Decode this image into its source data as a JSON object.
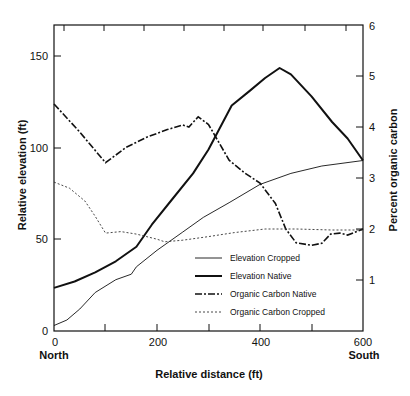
{
  "chart_data": {
    "type": "line",
    "title": "",
    "xlabel": "Relative distance (ft)",
    "ylabel": "Relative elevation (ft)",
    "ylabel_right": "Percent organic carbon",
    "xlim": [
      0,
      600
    ],
    "ylim": [
      0,
      165
    ],
    "ylim_right": [
      0,
      6
    ],
    "x_ticks": [
      0,
      200,
      400,
      600
    ],
    "x_tick_labels": [
      "0",
      "200",
      "400",
      "600"
    ],
    "x_end_annotations": {
      "left": "North",
      "right": "South"
    },
    "y_ticks": [
      0,
      50,
      100,
      150
    ],
    "y_tick_labels": [
      "0",
      "50",
      "100",
      "150"
    ],
    "y_right_ticks": [
      1,
      2,
      3,
      4,
      5,
      6
    ],
    "y_right_tick_labels": [
      "1",
      "2",
      "3",
      "4",
      "5",
      "6"
    ],
    "grid": false,
    "legend_position": "lower right inside",
    "series": [
      {
        "name": "Elevation Cropped",
        "axis": "left",
        "style": "thin-solid",
        "points": [
          [
            0,
            3
          ],
          [
            25,
            6
          ],
          [
            50,
            12
          ],
          [
            80,
            21
          ],
          [
            120,
            28
          ],
          [
            150,
            31
          ],
          [
            160,
            35
          ],
          [
            200,
            44
          ],
          [
            250,
            54
          ],
          [
            290,
            62
          ],
          [
            340,
            70
          ],
          [
            400,
            80
          ],
          [
            460,
            86
          ],
          [
            520,
            90
          ],
          [
            600,
            93
          ]
        ]
      },
      {
        "name": "Elevation Native",
        "axis": "left",
        "style": "thick-solid",
        "points": [
          [
            0,
            23.5
          ],
          [
            40,
            27
          ],
          [
            80,
            32
          ],
          [
            120,
            38
          ],
          [
            160,
            46
          ],
          [
            190,
            58
          ],
          [
            230,
            72
          ],
          [
            270,
            86
          ],
          [
            300,
            99
          ],
          [
            345,
            123
          ],
          [
            380,
            131
          ],
          [
            410,
            138
          ],
          [
            438,
            143.5
          ],
          [
            460,
            140
          ],
          [
            500,
            128
          ],
          [
            540,
            114
          ],
          [
            570,
            105
          ],
          [
            600,
            93
          ]
        ]
      },
      {
        "name": "Organic Carbon Native",
        "axis": "right",
        "style": "dash-dot",
        "points": [
          [
            0,
            4.45
          ],
          [
            50,
            3.9
          ],
          [
            100,
            3.3
          ],
          [
            140,
            3.6
          ],
          [
            180,
            3.8
          ],
          [
            220,
            3.95
          ],
          [
            250,
            4.04
          ],
          [
            262,
            4.0
          ],
          [
            280,
            4.2
          ],
          [
            300,
            4.05
          ],
          [
            340,
            3.35
          ],
          [
            370,
            3.1
          ],
          [
            400,
            2.9
          ],
          [
            430,
            2.5
          ],
          [
            450,
            2.0
          ],
          [
            470,
            1.73
          ],
          [
            500,
            1.68
          ],
          [
            520,
            1.72
          ],
          [
            537,
            1.9
          ],
          [
            555,
            1.92
          ],
          [
            570,
            1.88
          ],
          [
            600,
            2.0
          ]
        ]
      },
      {
        "name": "Organic Carbon Cropped",
        "axis": "right",
        "style": "dotted",
        "points": [
          [
            0,
            2.92
          ],
          [
            30,
            2.8
          ],
          [
            60,
            2.55
          ],
          [
            80,
            2.25
          ],
          [
            100,
            1.92
          ],
          [
            130,
            1.95
          ],
          [
            160,
            1.9
          ],
          [
            200,
            1.8
          ],
          [
            215,
            1.75
          ],
          [
            250,
            1.78
          ],
          [
            300,
            1.85
          ],
          [
            350,
            1.93
          ],
          [
            410,
            2.0
          ],
          [
            470,
            2.0
          ],
          [
            540,
            1.98
          ],
          [
            600,
            1.98
          ]
        ]
      }
    ]
  },
  "legend": {
    "items": [
      {
        "label": "Elevation Cropped"
      },
      {
        "label": "Elevation Native"
      },
      {
        "label": "Organic Carbon Native"
      },
      {
        "label": "Organic Carbon Cropped"
      }
    ]
  },
  "axes": {
    "x_title": "Relative distance (ft)",
    "y_left_title": "Relative elevation (ft)",
    "y_right_title": "Percent organic carbon",
    "x_left_end": "North",
    "x_right_end": "South",
    "x_tick_labels": [
      "0",
      "200",
      "400",
      "600"
    ],
    "y_left_tick_labels": [
      "0",
      "50",
      "100",
      "150"
    ],
    "y_right_tick_labels": [
      "1",
      "2",
      "3",
      "4",
      "5",
      "6"
    ]
  },
  "colors": {
    "line": "#111111",
    "background": "#ffffff"
  }
}
